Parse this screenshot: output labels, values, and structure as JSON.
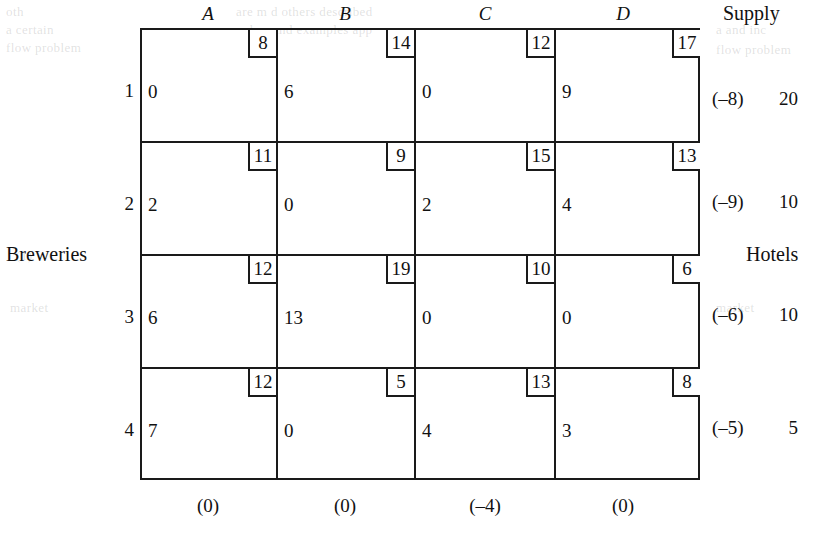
{
  "labels": {
    "row_group": "Breweries",
    "col_group": "Hotels",
    "supply_header": "Supply"
  },
  "columns": [
    {
      "name": "A",
      "dual": "(0)"
    },
    {
      "name": "B",
      "dual": "(0)"
    },
    {
      "name": "C",
      "dual": "(–4)"
    },
    {
      "name": "D",
      "dual": "(0)"
    }
  ],
  "rows": [
    {
      "name": "1",
      "dual": "(–8)",
      "supply": "20"
    },
    {
      "name": "2",
      "dual": "(–9)",
      "supply": "10"
    },
    {
      "name": "3",
      "dual": "(–6)",
      "supply": "10"
    },
    {
      "name": "4",
      "dual": "(–5)",
      "supply": "5"
    }
  ],
  "cells": [
    [
      {
        "cost": "8",
        "value": "0"
      },
      {
        "cost": "14",
        "value": "6"
      },
      {
        "cost": "12",
        "value": "0"
      },
      {
        "cost": "17",
        "value": "9"
      }
    ],
    [
      {
        "cost": "11",
        "value": "2"
      },
      {
        "cost": "9",
        "value": "0"
      },
      {
        "cost": "15",
        "value": "2"
      },
      {
        "cost": "13",
        "value": "4"
      }
    ],
    [
      {
        "cost": "12",
        "value": "6"
      },
      {
        "cost": "19",
        "value": "13"
      },
      {
        "cost": "10",
        "value": "0"
      },
      {
        "cost": "6",
        "value": "0"
      }
    ],
    [
      {
        "cost": "12",
        "value": "7"
      },
      {
        "cost": "5",
        "value": "0"
      },
      {
        "cost": "13",
        "value": "4"
      },
      {
        "cost": "8",
        "value": "3"
      }
    ]
  ],
  "chart_data": {
    "type": "table",
    "xlabel": "Hotels",
    "ylabel": "Breweries",
    "categories": [
      "A",
      "B",
      "C",
      "D"
    ],
    "row_categories": [
      "1",
      "2",
      "3",
      "4"
    ],
    "costs": [
      [
        8,
        14,
        12,
        17
      ],
      [
        11,
        9,
        15,
        13
      ],
      [
        12,
        19,
        10,
        6
      ],
      [
        12,
        5,
        13,
        8
      ]
    ],
    "allocations": [
      [
        0,
        6,
        0,
        9
      ],
      [
        2,
        0,
        2,
        4
      ],
      [
        6,
        13,
        0,
        0
      ],
      [
        7,
        0,
        4,
        3
      ]
    ],
    "supply": [
      20,
      10,
      10,
      5
    ],
    "row_duals": [
      -8,
      -9,
      -6,
      -5
    ],
    "col_duals": [
      0,
      0,
      -4,
      0
    ]
  },
  "ghost_text": [
    {
      "t": "oth",
      "x": 6,
      "y": 4
    },
    {
      "t": "a certain",
      "x": 6,
      "y": 22
    },
    {
      "t": "flow problem",
      "x": 6,
      "y": 40
    },
    {
      "t": "are m   d   others described",
      "x": 236,
      "y": 4
    },
    {
      "t": "bus and examples app",
      "x": 250,
      "y": 22
    },
    {
      "t": "(1)",
      "x": 16,
      "y": 248
    },
    {
      "t": "market",
      "x": 10,
      "y": 300
    },
    {
      "t": "a and inc",
      "x": 716,
      "y": 22
    },
    {
      "t": "flow problem",
      "x": 716,
      "y": 42
    },
    {
      "t": "market",
      "x": 716,
      "y": 300
    }
  ]
}
